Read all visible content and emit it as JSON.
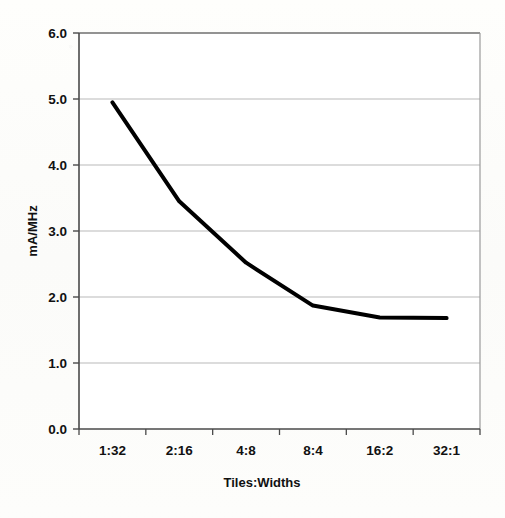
{
  "chart_data": {
    "type": "line",
    "title": "",
    "xlabel": "Tiles:Widths",
    "ylabel": "mA/MHz",
    "categories": [
      "1:32",
      "2:16",
      "4:8",
      "8:4",
      "16:2",
      "32:1"
    ],
    "values": [
      4.95,
      3.45,
      2.52,
      1.87,
      1.69,
      1.68
    ],
    "series": [
      {
        "name": "mA/MHz",
        "values": [
          4.95,
          3.45,
          2.52,
          1.87,
          1.69,
          1.68
        ]
      }
    ],
    "ylim": [
      0.0,
      6.0
    ],
    "ytick_labels": [
      "0.0",
      "1.0",
      "2.0",
      "3.0",
      "4.0",
      "5.0",
      "6.0"
    ],
    "ytick_values": [
      0.0,
      1.0,
      2.0,
      3.0,
      4.0,
      5.0,
      6.0
    ],
    "grid": true,
    "grid_axis": "y",
    "legend": false,
    "legend_position": "none",
    "line_color": "#000000",
    "line_width": 4,
    "markers": false,
    "plot_background": "#ffffff",
    "frame": true
  },
  "figure": {
    "axis_title_x": "Tiles:Widths",
    "axis_title_y": "mA/MHz",
    "tick_color": "#111111",
    "grid_color": "#b9b9b9",
    "frame_color": "#6f6f6f"
  }
}
